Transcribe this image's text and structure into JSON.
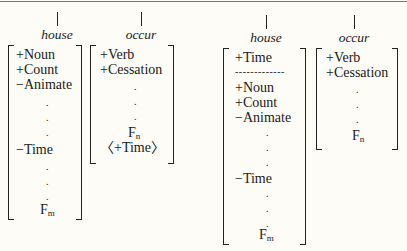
{
  "diagram": {
    "left_panel": {
      "house": {
        "label": "house",
        "features": [
          "+Noun",
          "+Count",
          "−Animate",
          ".",
          ".",
          ".",
          "−Time",
          ".",
          ".",
          ".",
          "Fm"
        ]
      },
      "occur": {
        "label": "occur",
        "features": [
          "+Verb",
          "+Cessation",
          ".",
          ".",
          ".",
          "Fn",
          "〈+Time〉"
        ]
      }
    },
    "right_panel": {
      "house": {
        "label": "house",
        "features": [
          "+Time",
          "-------------",
          "+Noun",
          "+Count",
          "−Animate",
          ".",
          ".",
          ".",
          "−Time",
          ".",
          ".",
          ".",
          "Fm"
        ]
      },
      "occur": {
        "label": "occur",
        "features": [
          "+Verb",
          "+Cessation",
          ".",
          ".",
          ".",
          "Fn"
        ]
      }
    },
    "text": {
      "plus_noun": "+Noun",
      "plus_count": "+Count",
      "minus_animate": "−Animate",
      "minus_time": "−Time",
      "plus_time": "+Time",
      "plus_verb": "+Verb",
      "plus_cessation": "+Cessation",
      "opt_plus_time": "〈+Time〉",
      "F": "F",
      "m": "m",
      "n": "n",
      "dot": ".",
      "dashes": "-------------",
      "house": "house",
      "occur": "occur"
    }
  }
}
